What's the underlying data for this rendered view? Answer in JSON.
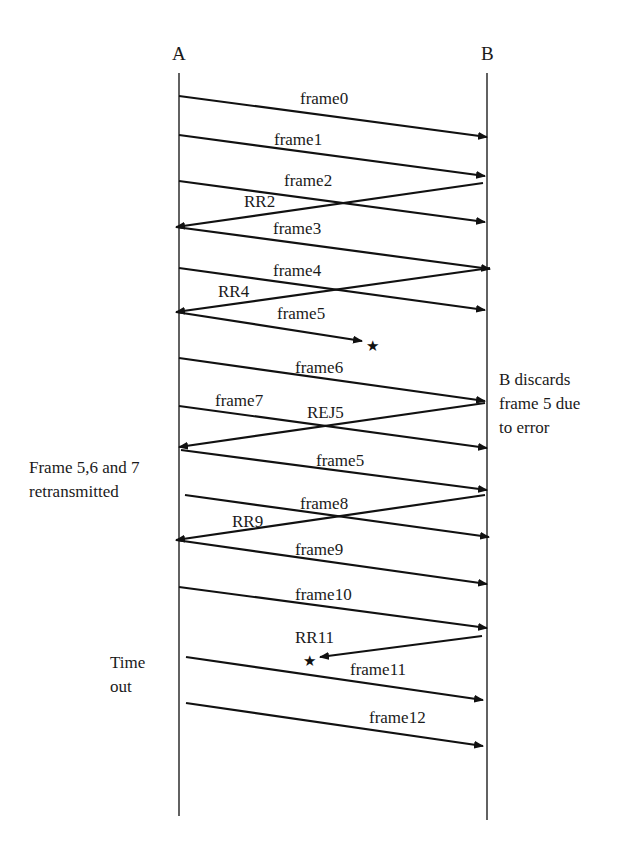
{
  "diagram": {
    "type": "sequence-diagram",
    "actors": [
      {
        "id": "A",
        "label": "A",
        "x": 179
      },
      {
        "id": "B",
        "label": "B",
        "x": 487
      }
    ],
    "messages": [
      {
        "label": "frame0",
        "from": "A",
        "to": "B",
        "x1": 179,
        "y1": 96,
        "x2": 487,
        "y2": 137,
        "lx": 300,
        "ly": 104
      },
      {
        "label": "frame1",
        "from": "A",
        "to": "B",
        "x1": 179,
        "y1": 135,
        "x2": 485,
        "y2": 176,
        "lx": 274,
        "ly": 145
      },
      {
        "label": "frame2",
        "from": "A",
        "to": "B",
        "x1": 179,
        "y1": 181,
        "x2": 485,
        "y2": 222,
        "lx": 284,
        "ly": 186
      },
      {
        "label": "RR2",
        "from": "B",
        "to": "A",
        "x1": 483,
        "y1": 183,
        "x2": 176,
        "y2": 227,
        "lx": 244,
        "ly": 207
      },
      {
        "label": "frame3",
        "from": "A",
        "to": "B",
        "x1": 176,
        "y1": 227,
        "x2": 490,
        "y2": 269,
        "lx": 273,
        "ly": 234
      },
      {
        "label": "frame4",
        "from": "A",
        "to": "B",
        "x1": 179,
        "y1": 268,
        "x2": 485,
        "y2": 310,
        "lx": 273,
        "ly": 276
      },
      {
        "label": "RR4",
        "from": "B",
        "to": "A",
        "x1": 490,
        "y1": 268,
        "x2": 176,
        "y2": 312,
        "lx": 218,
        "ly": 297
      },
      {
        "label": "frame5",
        "from": "A",
        "to": "lost",
        "x1": 176,
        "y1": 312,
        "x2": 362,
        "y2": 341,
        "lx": 277,
        "ly": 319,
        "lost": true,
        "star": {
          "x": 366,
          "y": 351
        }
      },
      {
        "label": "frame6",
        "from": "A",
        "to": "B",
        "x1": 179,
        "y1": 358,
        "x2": 485,
        "y2": 401,
        "lx": 295,
        "ly": 373
      },
      {
        "label": "frame7",
        "from": "A",
        "to": "B",
        "x1": 179,
        "y1": 406,
        "x2": 487,
        "y2": 448,
        "lx": 215,
        "ly": 406
      },
      {
        "label": "REJ5",
        "from": "B",
        "to": "A",
        "x1": 485,
        "y1": 403,
        "x2": 179,
        "y2": 447,
        "lx": 307,
        "ly": 418
      },
      {
        "label": "frame5",
        "from": "A",
        "to": "B",
        "x1": 181,
        "y1": 450,
        "x2": 487,
        "y2": 490,
        "lx": 316,
        "ly": 466
      },
      {
        "label": "frame8",
        "from": "A",
        "to": "B",
        "x1": 185,
        "y1": 495,
        "x2": 489,
        "y2": 537,
        "lx": 300,
        "ly": 509
      },
      {
        "label": "RR9",
        "from": "B",
        "to": "A",
        "x1": 485,
        "y1": 495,
        "x2": 176,
        "y2": 540,
        "lx": 232,
        "ly": 527
      },
      {
        "label": "frame9",
        "from": "A",
        "to": "B",
        "x1": 176,
        "y1": 540,
        "x2": 487,
        "y2": 584,
        "lx": 295,
        "ly": 555
      },
      {
        "label": "frame10",
        "from": "A",
        "to": "B",
        "x1": 179,
        "y1": 587,
        "x2": 487,
        "y2": 628,
        "lx": 295,
        "ly": 600
      },
      {
        "label": "RR11",
        "from": "B",
        "to": "lost",
        "x1": 482,
        "y1": 636,
        "x2": 320,
        "y2": 657,
        "lx": 295,
        "ly": 643,
        "lost": true,
        "star": {
          "x": 303,
          "y": 666
        }
      },
      {
        "label": "frame11",
        "from": "A",
        "to": "B",
        "x1": 186,
        "y1": 657,
        "x2": 483,
        "y2": 700,
        "lx": 350,
        "ly": 675
      },
      {
        "label": "frame12",
        "from": "A",
        "to": "B",
        "x1": 186,
        "y1": 703,
        "x2": 483,
        "y2": 746,
        "lx": 369,
        "ly": 723
      }
    ],
    "annotations": [
      {
        "id": "b-discards",
        "lines": [
          "B discards",
          "frame 5 due",
          "to error"
        ],
        "x": 499,
        "y": 385
      },
      {
        "id": "retransmitted",
        "lines": [
          "Frame 5,6 and 7",
          "retransmitted"
        ],
        "x": 29,
        "y": 473
      },
      {
        "id": "timeout",
        "lines": [
          "Time",
          "out"
        ],
        "x": 110,
        "y": 668
      }
    ],
    "colors": {
      "line": "#111111",
      "lifeline": "#3a3a3a",
      "text": "#1a1a1a",
      "background": "#ffffff"
    }
  }
}
